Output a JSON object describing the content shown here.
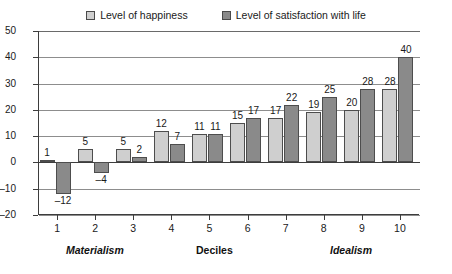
{
  "chart_data": {
    "type": "bar",
    "title": "",
    "subtitle": "",
    "xlabel": "Deciles",
    "ylabel": "",
    "categories": [
      "1",
      "2",
      "3",
      "4",
      "5",
      "6",
      "7",
      "8",
      "9",
      "10"
    ],
    "series": [
      {
        "name": "Level of happiness",
        "color": "#cfcfcf",
        "values": [
          1,
          5,
          5,
          12,
          11,
          15,
          17,
          19,
          20,
          28
        ]
      },
      {
        "name": "Level of satisfaction with life",
        "color": "#8a8a8a",
        "values": [
          -12,
          -4,
          2,
          7,
          11,
          17,
          22,
          25,
          28,
          40
        ]
      }
    ],
    "ylim": [
      -20,
      50
    ],
    "yticks": [
      50,
      40,
      30,
      20,
      10,
      0,
      -10,
      -20
    ],
    "ytick_labels": [
      "50",
      "40",
      "30",
      "20",
      "10",
      "0",
      "-10",
      "-20"
    ],
    "grid": true,
    "grid_axis": "y",
    "legend_position": "top",
    "annotations": [
      {
        "text": "Materialism",
        "position": "x-axis-left",
        "style": "bold-italic"
      },
      {
        "text": "Deciles",
        "position": "x-axis-center",
        "style": "bold"
      },
      {
        "text": "Idealism",
        "position": "x-axis-right",
        "style": "bold-italic"
      }
    ],
    "data_labels": {
      "happiness": [
        "1",
        "5",
        "5",
        "12",
        "11",
        "15",
        "17",
        "19",
        "20",
        "28"
      ],
      "satisfaction": [
        "-12",
        "-4",
        "2",
        "7",
        "11",
        "17",
        "22",
        "25",
        "28",
        "40"
      ]
    }
  },
  "legend": {
    "entries": [
      {
        "label": "Level of happiness",
        "swatch": "light-gray-swatch-icon"
      },
      {
        "label": "Level of satisfaction with life",
        "swatch": "dark-gray-swatch-icon"
      }
    ]
  },
  "axes": {
    "y_labels": [
      "50",
      "40",
      "30",
      "20",
      "10",
      "0",
      "-10",
      "-20"
    ],
    "x_labels": [
      "1",
      "2",
      "3",
      "4",
      "5",
      "6",
      "7",
      "8",
      "9",
      "10"
    ],
    "annotation_left": "Materialism",
    "annotation_center": "Deciles",
    "annotation_right": "Idealism"
  }
}
